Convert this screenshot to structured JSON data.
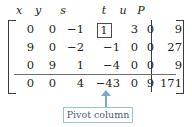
{
  "figure": {
    "type": "simplex-tableau",
    "column_headers": [
      "x",
      "y",
      "s",
      "t",
      "u",
      "P"
    ],
    "rows": [
      {
        "cells": [
          "0",
          "0",
          "−1",
          "1",
          "3",
          "0"
        ],
        "rhs": "9",
        "boxed_index": 3
      },
      {
        "cells": [
          "9",
          "0",
          "−2",
          "−1",
          "0",
          "0"
        ],
        "rhs": "27",
        "boxed_index": -1
      },
      {
        "cells": [
          "0",
          "9",
          "1",
          "−4",
          "0",
          "0"
        ],
        "rhs": "9",
        "boxed_index": -1
      },
      {
        "cells": [
          "0",
          "0",
          "4",
          "−43",
          "0",
          "9"
        ],
        "rhs": "171",
        "boxed_index": -1
      }
    ],
    "objective_row_index": 3,
    "callout": {
      "label": "Pivot column",
      "points_at_column": "t",
      "border_color": "#9cc2dd",
      "text_color": "#3f5d7d",
      "arrow_color": "#7ba7cc"
    },
    "colors": {
      "ink": "#231f20",
      "rule": "#6d6d6d",
      "bracket": "#3b3b3b",
      "background": "#ffffff"
    }
  }
}
